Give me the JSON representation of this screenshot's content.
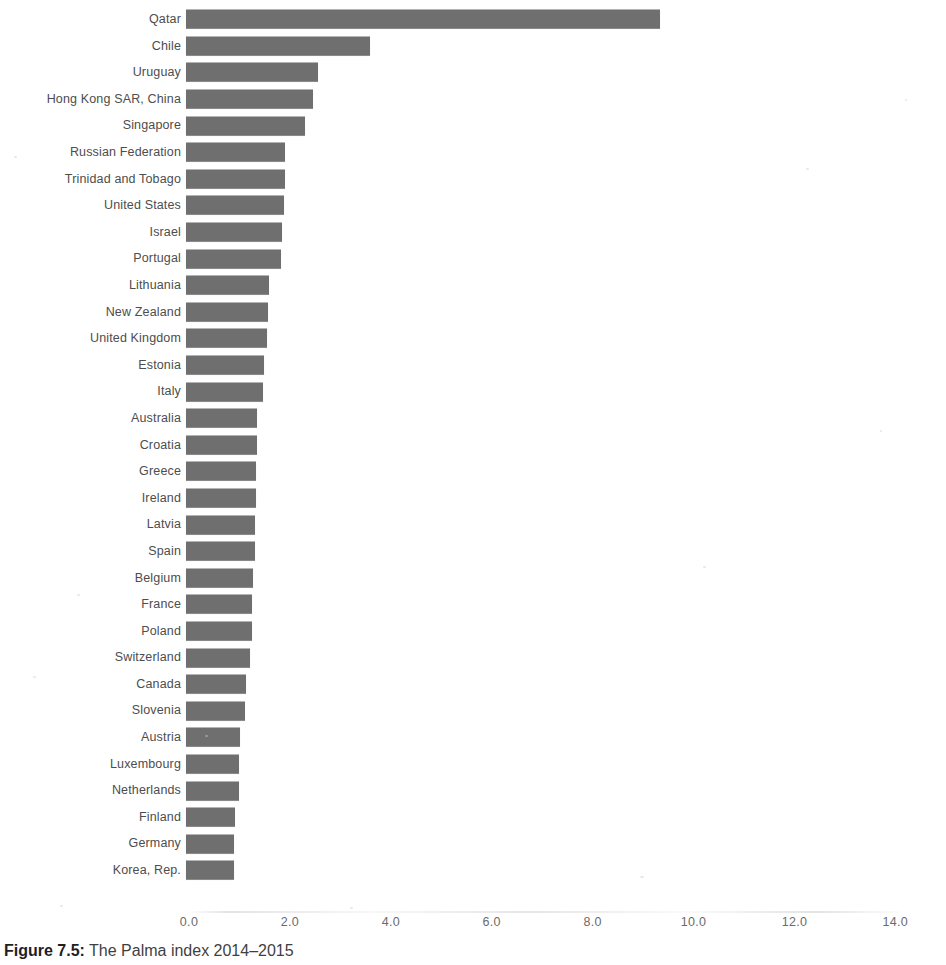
{
  "caption": {
    "label": "Figure 7.5:",
    "text": " The Palma index 2014–2015"
  },
  "axis": {
    "ticks": [
      "0.0",
      "2.0",
      "4.0",
      "6.0",
      "8.0",
      "10.0",
      "12.0",
      "14.0"
    ]
  },
  "colors": {
    "bar": "#6f6f6f",
    "label": "#4d4d4d",
    "tick": "#6b6b6b",
    "background": "#ffffff"
  },
  "chart_data": {
    "type": "bar",
    "orientation": "horizontal",
    "title": "Figure 7.5: The Palma index 2014–2015",
    "xlabel": "",
    "ylabel": "",
    "xlim": [
      0.0,
      14.0
    ],
    "xticks": [
      0.0,
      2.0,
      4.0,
      6.0,
      8.0,
      10.0,
      12.0,
      14.0
    ],
    "grid": false,
    "legend": null,
    "categories": [
      "Qatar",
      "Chile",
      "Uruguay",
      "Hong Kong SAR, China",
      "Singapore",
      "Russian Federation",
      "Trinidad and Tobago",
      "United States",
      "Israel",
      "Portugal",
      "Lithuania",
      "New Zealand",
      "United Kingdom",
      "Estonia",
      "Italy",
      "Australia",
      "Croatia",
      "Greece",
      "Ireland",
      "Latvia",
      "Spain",
      "Belgium",
      "France",
      "Poland",
      "Switzerland",
      "Canada",
      "Slovenia",
      "Austria",
      "Luxembourg",
      "Netherlands",
      "Finland",
      "Germany",
      "Korea, Rep."
    ],
    "values": [
      9.4,
      3.65,
      2.62,
      2.52,
      2.36,
      1.97,
      1.96,
      1.95,
      1.9,
      1.88,
      1.64,
      1.62,
      1.61,
      1.54,
      1.52,
      1.41,
      1.4,
      1.39,
      1.38,
      1.37,
      1.36,
      1.32,
      1.31,
      1.3,
      1.27,
      1.18,
      1.16,
      1.07,
      1.06,
      1.05,
      0.97,
      0.96,
      0.95
    ]
  }
}
